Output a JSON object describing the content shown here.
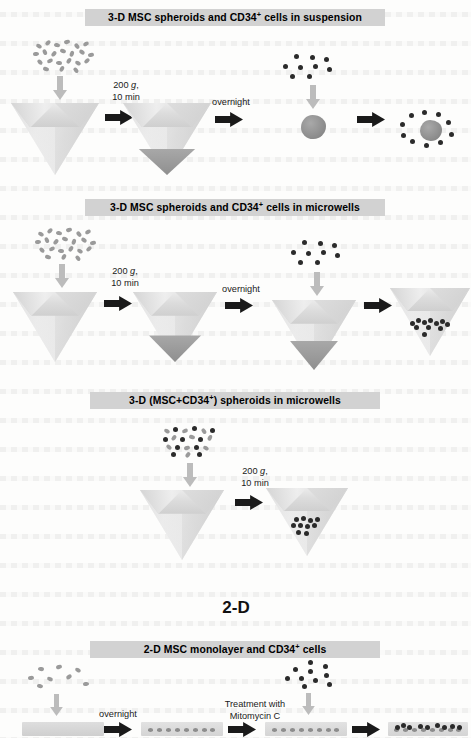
{
  "figure": {
    "section_heading_2d": "2-D",
    "panels": [
      {
        "id": "panel-3d-suspension",
        "banner": "3-D MSC spheroids and CD34",
        "banner_sup": "+",
        "banner_tail": " cells in suspension",
        "banner_full": "3-D MSC spheroids and CD34+ cells in suspension",
        "steps": [
          {
            "label_line1": "200 g,",
            "label_line2": "10 min",
            "italic_token": "g"
          },
          {
            "label_line1": "overnight",
            "label_line2": ""
          },
          {
            "label_line1": "",
            "label_line2": ""
          }
        ],
        "stages": [
          {
            "name": "msc-cell-cloud",
            "kind": "msc-cloud",
            "count": 22
          },
          {
            "name": "empty-conical-tube",
            "kind": "tube"
          },
          {
            "name": "tube-with-msc-pellet",
            "kind": "tube-pellet"
          },
          {
            "name": "cd34-cell-cloud",
            "kind": "cd34-cloud",
            "count": 9
          },
          {
            "name": "msc-spheroid",
            "kind": "spheroid"
          },
          {
            "name": "spheroid-with-cd34-cells",
            "kind": "spheroid-surrounded",
            "count": 10
          }
        ]
      },
      {
        "id": "panel-3d-microwells",
        "banner": "3-D MSC spheroids and CD34",
        "banner_sup": "+",
        "banner_tail": " cells in microwells",
        "banner_full": "3-D MSC spheroids and CD34+ cells in microwells",
        "steps": [
          {
            "label_line1": "200 g,",
            "label_line2": "10 min",
            "italic_token": "g"
          },
          {
            "label_line1": "overnight",
            "label_line2": ""
          },
          {
            "label_line1": "",
            "label_line2": ""
          }
        ],
        "stages": [
          {
            "name": "msc-cell-cloud",
            "kind": "msc-cloud",
            "count": 22
          },
          {
            "name": "empty-microwell",
            "kind": "tube"
          },
          {
            "name": "microwell-with-msc-pellet",
            "kind": "tube-pellet"
          },
          {
            "name": "cd34-cell-cloud",
            "kind": "cd34-cloud",
            "count": 9
          },
          {
            "name": "microwell-with-spheroid",
            "kind": "tube-pellet"
          },
          {
            "name": "microwell-with-spheroid-and-cd34",
            "kind": "tube-dark-cells"
          }
        ]
      },
      {
        "id": "panel-3d-mixed-spheroids",
        "banner": "3-D (MSC+CD34",
        "banner_sup": "+",
        "banner_tail": ") spheroids in microwells",
        "banner_full": "3-D (MSC+CD34+) spheroids in microwells",
        "steps": [
          {
            "label_line1": "200 g,",
            "label_line2": "10 min",
            "italic_token": "g"
          }
        ],
        "stages": [
          {
            "name": "mixed-cell-cloud",
            "kind": "mixed-cloud"
          },
          {
            "name": "empty-microwell",
            "kind": "tube"
          },
          {
            "name": "microwell-with-mixed-spheroid",
            "kind": "tube-dark-cells"
          }
        ]
      },
      {
        "id": "panel-2d-monolayer",
        "banner": "2-D MSC monolayer and CD34",
        "banner_sup": "+",
        "banner_tail": " cells",
        "banner_full": "2-D MSC monolayer and CD34+ cells",
        "steps": [
          {
            "label_line1": "overnight",
            "label_line2": ""
          },
          {
            "label_line1": "Treatment with",
            "label_line2": "Mitomycin C"
          },
          {
            "label_line1": "",
            "label_line2": ""
          }
        ],
        "stages": [
          {
            "name": "msc-cell-cloud",
            "kind": "msc-cloud-sparse",
            "count": 8
          },
          {
            "name": "empty-culture-dish",
            "kind": "dish-blank"
          },
          {
            "name": "dish-with-msc-monolayer",
            "kind": "dish-mono"
          },
          {
            "name": "dish-with-treated-monolayer",
            "kind": "dish-mono"
          },
          {
            "name": "cd34-cell-cloud",
            "kind": "cd34-cloud",
            "count": 10
          },
          {
            "name": "dish-with-cocultured-cells",
            "kind": "dish-coculture"
          }
        ]
      }
    ],
    "colors": {
      "banner_background": "#d2d2d2",
      "banner_text": "#000000",
      "msc_cell": "#9a9a9a",
      "cd34_cell": "#2b2b2b",
      "down_arrow": "#bcbcbc",
      "right_arrow": "#1a1a1a",
      "tube_body": "#e6e6e6",
      "pellet": "#9a9a9a",
      "page_background": "#fdfdfc"
    }
  }
}
